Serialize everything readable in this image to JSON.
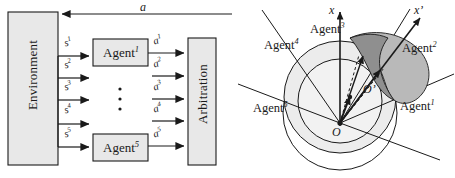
{
  "figure": {
    "panels": [
      {
        "id": "left",
        "name": "multi-agent-architecture-block-diagram"
      },
      {
        "id": "right",
        "name": "agent-sector-geometry-diagram"
      }
    ]
  },
  "block_diagram": {
    "environment_block": {
      "label": "Environment"
    },
    "arbitration_block": {
      "label": "Arbitration"
    },
    "agent_blocks": [
      {
        "base": "Agent",
        "sup": "1"
      },
      {
        "base": "Agent",
        "sup": "5"
      }
    ],
    "vertical_ellipsis": "⋮",
    "state_signals": [
      {
        "base": "s",
        "sup": "1"
      },
      {
        "base": "s",
        "sup": "2"
      },
      {
        "base": "s",
        "sup": "3"
      },
      {
        "base": "s",
        "sup": "4"
      },
      {
        "base": "s",
        "sup": "5"
      }
    ],
    "action_signals": [
      {
        "base": "a",
        "sup": "1"
      },
      {
        "base": "a",
        "sup": "2"
      },
      {
        "base": "a",
        "sup": "3"
      },
      {
        "base": "a",
        "sup": "4"
      },
      {
        "base": "a",
        "sup": "5"
      }
    ],
    "feedback_signal": {
      "base": "a",
      "sup": ""
    }
  },
  "geometry_diagram": {
    "axes": [
      {
        "name": "x-axis",
        "label": "x",
        "prime": ""
      },
      {
        "name": "x-prime-axis",
        "label": "x",
        "prime": "’"
      }
    ],
    "origins": [
      {
        "name": "origin-O",
        "label": "O",
        "prime": ""
      },
      {
        "name": "origin-O-prime",
        "label": "O",
        "prime": "’"
      }
    ],
    "agent_regions": [
      {
        "base": "Agent",
        "sup": "1"
      },
      {
        "base": "Agent",
        "sup": "2"
      },
      {
        "base": "Agent",
        "sup": "3"
      },
      {
        "base": "Agent",
        "sup": "4"
      },
      {
        "base": "Agent",
        "sup": "5"
      }
    ]
  },
  "colors": {
    "stroke": "#1a1a1a",
    "box_fill": "#e8e8e8",
    "light_disc": "#ececec",
    "shaded_band_light": "#b9b9b9",
    "shaded_band_dark": "#8f8f8f",
    "background": "#ffffff"
  }
}
